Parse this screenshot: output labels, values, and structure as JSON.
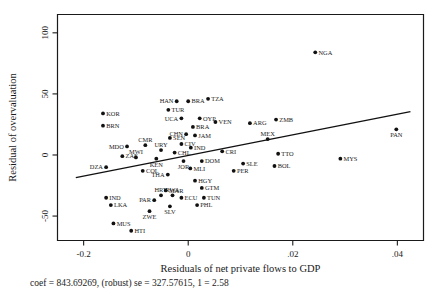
{
  "chart_data": {
    "type": "scatter",
    "title": "",
    "xlabel": "Residuals of net private flows to GDP",
    "ylabel": "Residual of overvaluation",
    "caption": "coef = 843.69269, (robust) se = 327.57615, 1 = 2.58",
    "xlim": [
      -0.025,
      0.045
    ],
    "ylim": [
      -70,
      115
    ],
    "xticks": [
      -0.02,
      0,
      0.02,
      0.04
    ],
    "xticklabels": [
      "-0.2",
      "0",
      ".02",
      ".04"
    ],
    "yticks": [
      -50,
      0,
      50,
      100
    ],
    "yticklabels": [
      "-50",
      "0",
      "50",
      "100"
    ],
    "grid": false,
    "legend": null,
    "fit_line": {
      "slope": 843.69269,
      "x_start": -0.0215,
      "y_start": -18.5,
      "x_end": 0.0425,
      "y_end": 35.5
    },
    "points": [
      {
        "label": "NGA",
        "x": 0.0243,
        "y": 84,
        "lp": "right"
      },
      {
        "label": "TZA",
        "x": 0.0038,
        "y": 46,
        "lp": "right"
      },
      {
        "label": "BRA",
        "x": 0.0,
        "y": 44,
        "lp": "right"
      },
      {
        "label": "HAN",
        "x": -0.0022,
        "y": 44,
        "lp": "left"
      },
      {
        "label": "TUR",
        "x": -0.0038,
        "y": 37,
        "lp": "right"
      },
      {
        "label": "KOR",
        "x": -0.0163,
        "y": 34,
        "lp": "right"
      },
      {
        "label": "OYP",
        "x": 0.0022,
        "y": 30,
        "lp": "right"
      },
      {
        "label": "UCA",
        "x": -0.0013,
        "y": 30,
        "lp": "left"
      },
      {
        "label": "ZMB",
        "x": 0.0168,
        "y": 29,
        "lp": "right"
      },
      {
        "label": "VEN",
        "x": 0.0052,
        "y": 27,
        "lp": "right"
      },
      {
        "label": "ARG",
        "x": 0.0118,
        "y": 26,
        "lp": "right"
      },
      {
        "label": "BRN",
        "x": -0.0163,
        "y": 24,
        "lp": "right"
      },
      {
        "label": "BRA",
        "x": 0.0009,
        "y": 23,
        "lp": "right"
      },
      {
        "label": "PAN",
        "x": 0.0398,
        "y": 21,
        "lp": "below"
      },
      {
        "label": "JAM",
        "x": 0.0013,
        "y": 16,
        "lp": "right"
      },
      {
        "label": "CHN",
        "x": -0.0004,
        "y": 17,
        "lp": "left"
      },
      {
        "label": "SEN",
        "x": -0.0035,
        "y": 14,
        "lp": "right"
      },
      {
        "label": "MEX",
        "x": 0.0152,
        "y": 13,
        "lp": "above"
      },
      {
        "label": "CIV",
        "x": -0.0013,
        "y": 9,
        "lp": "right"
      },
      {
        "label": "CMR",
        "x": -0.0082,
        "y": 8,
        "lp": "above"
      },
      {
        "label": "MDO",
        "x": -0.0117,
        "y": 7,
        "lp": "left"
      },
      {
        "label": "IND",
        "x": 0.0005,
        "y": 6,
        "lp": "right"
      },
      {
        "label": "URY",
        "x": -0.0052,
        "y": 4,
        "lp": "above"
      },
      {
        "label": "CHL",
        "x": -0.0026,
        "y": 2,
        "lp": "right"
      },
      {
        "label": "TTO",
        "x": 0.0172,
        "y": 1,
        "lp": "right"
      },
      {
        "label": "CRI",
        "x": 0.0065,
        "y": 3,
        "lp": "right"
      },
      {
        "label": "ZAF",
        "x": -0.0126,
        "y": -1,
        "lp": "right"
      },
      {
        "label": "MWI",
        "x": -0.01,
        "y": -2,
        "lp": "above"
      },
      {
        "label": "KEN",
        "x": -0.0061,
        "y": -3,
        "lp": "below"
      },
      {
        "label": "MYS",
        "x": 0.0291,
        "y": -3,
        "lp": "right"
      },
      {
        "label": "JOR",
        "x": -0.0009,
        "y": -5,
        "lp": "below"
      },
      {
        "label": "DOM",
        "x": 0.0026,
        "y": -5,
        "lp": "right"
      },
      {
        "label": "SLE",
        "x": 0.0105,
        "y": -7,
        "lp": "right"
      },
      {
        "label": "BOL",
        "x": 0.0165,
        "y": -9,
        "lp": "right"
      },
      {
        "label": "DZA",
        "x": -0.0157,
        "y": -10,
        "lp": "left"
      },
      {
        "label": "MLI",
        "x": 0.0004,
        "y": -11,
        "lp": "right"
      },
      {
        "label": "COL",
        "x": -0.0087,
        "y": -13,
        "lp": "right"
      },
      {
        "label": "PER",
        "x": 0.0087,
        "y": -13,
        "lp": "right"
      },
      {
        "label": "THA",
        "x": -0.0039,
        "y": -16,
        "lp": "left"
      },
      {
        "label": "HGY",
        "x": 0.0013,
        "y": -21,
        "lp": "right"
      },
      {
        "label": "GTM",
        "x": 0.0026,
        "y": -27,
        "lp": "right"
      },
      {
        "label": "MAR",
        "x": -0.0043,
        "y": -29,
        "lp": "right"
      },
      {
        "label": "RWA",
        "x": -0.003,
        "y": -33,
        "lp": "above"
      },
      {
        "label": "HRY",
        "x": -0.0052,
        "y": -33,
        "lp": "above"
      },
      {
        "label": "ECU",
        "x": -0.0013,
        "y": -35,
        "lp": "right"
      },
      {
        "label": "TUN",
        "x": 0.003,
        "y": -35,
        "lp": "right"
      },
      {
        "label": "IND",
        "x": -0.0157,
        "y": -35,
        "lp": "right"
      },
      {
        "label": "PAR",
        "x": -0.0065,
        "y": -37,
        "lp": "left"
      },
      {
        "label": "PHL",
        "x": 0.0017,
        "y": -41,
        "lp": "right"
      },
      {
        "label": "LKA",
        "x": -0.0148,
        "y": -41,
        "lp": "right"
      },
      {
        "label": "ZWE",
        "x": -0.0074,
        "y": -46,
        "lp": "below"
      },
      {
        "label": "SLV",
        "x": -0.0035,
        "y": -42,
        "lp": "below"
      },
      {
        "label": "MUS",
        "x": -0.0143,
        "y": -56,
        "lp": "right"
      },
      {
        "label": "HTI",
        "x": -0.0109,
        "y": -62,
        "lp": "right"
      }
    ]
  }
}
